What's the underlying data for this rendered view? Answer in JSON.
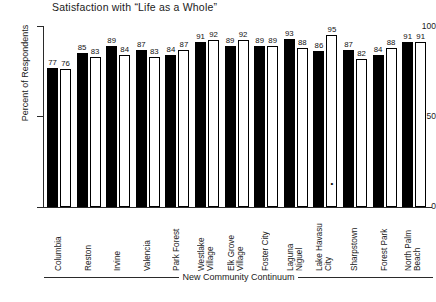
{
  "chart_data": {
    "type": "bar",
    "title": "Satisfaction with “Life as a Whole”",
    "xlabel": "New Community Continuum",
    "ylabel": "Percent of Respondents",
    "ylim": [
      0,
      100
    ],
    "yticks": [
      0,
      50,
      100
    ],
    "ytick_labels": [
      "0",
      "50",
      "100"
    ],
    "grid": false,
    "legend": "none",
    "categories": [
      "Columbia",
      "Reston",
      "Irvine",
      "Valencia",
      "Park Forest",
      "Westlake Village",
      "Elk Grove Village",
      "Foster City",
      "Laguna Niguel",
      "Lake Havasu City",
      "Sharpstown",
      "Forest Park",
      "North Palm Beach"
    ],
    "category_lines": [
      [
        "Columbia"
      ],
      [
        "Reston"
      ],
      [
        "Irvine"
      ],
      [
        "Valencia"
      ],
      [
        "Park Forest"
      ],
      [
        "Westlake",
        "Village"
      ],
      [
        "Elk Grove",
        "Village"
      ],
      [
        "Foster City"
      ],
      [
        "Laguna",
        "Niguel"
      ],
      [
        "Lake Havasu",
        "City"
      ],
      [
        "Sharpstown"
      ],
      [
        "Forest Park"
      ],
      [
        "North Palm",
        "Beach"
      ]
    ],
    "series": [
      {
        "name": "series-dark",
        "style": "filled-black",
        "values": [
          77,
          85,
          89,
          87,
          84,
          91,
          89,
          89,
          93,
          86,
          87,
          84,
          91
        ]
      },
      {
        "name": "series-light",
        "style": "outlined-white",
        "values": [
          76,
          83,
          84,
          83,
          87,
          92,
          92,
          89,
          88,
          95,
          82,
          88,
          91
        ]
      }
    ],
    "annotations": [
      {
        "symbol": "•",
        "category": "Lake Havasu City",
        "series": "series-light"
      }
    ]
  }
}
